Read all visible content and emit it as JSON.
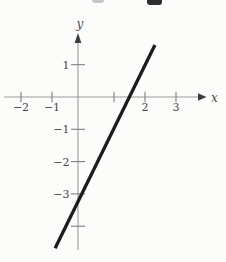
{
  "figure": {
    "background": "#fcfcfb",
    "artifacts": [
      {
        "name": "cropped-text-fragment-left",
        "color": "#c6c6c6"
      },
      {
        "name": "cropped-text-fragment-right",
        "color": "#2e2e2e"
      }
    ]
  },
  "chart_data": {
    "type": "line",
    "title": "",
    "xlabel": "x",
    "ylabel": "y",
    "grid": false,
    "legend": false,
    "xlim": [
      -2.5,
      3.9
    ],
    "ylim": [
      -5.1,
      2.1
    ],
    "x_ticks": [
      {
        "value": -2,
        "label": "−2"
      },
      {
        "value": -1,
        "label": "−1"
      },
      {
        "value": 1,
        "label": ""
      },
      {
        "value": 2,
        "label": "2"
      },
      {
        "value": 3,
        "label": "3"
      }
    ],
    "y_ticks": [
      {
        "value": 1,
        "label": "1"
      },
      {
        "value": -1,
        "label": "−1"
      },
      {
        "value": -2,
        "label": "−2"
      },
      {
        "value": -3,
        "label": "−3"
      },
      {
        "value": -4,
        "label": ""
      }
    ],
    "series": [
      {
        "name": "plotted-line",
        "style": "solid",
        "color": "#1c1c1c",
        "stroke_width": 3.3,
        "segment": {
          "from": [
            -0.9,
            -4.68
          ],
          "to": [
            2.32,
            1.61
          ]
        },
        "slope": 2,
        "y_intercept": -3,
        "x_intercept": 1.5
      }
    ]
  }
}
